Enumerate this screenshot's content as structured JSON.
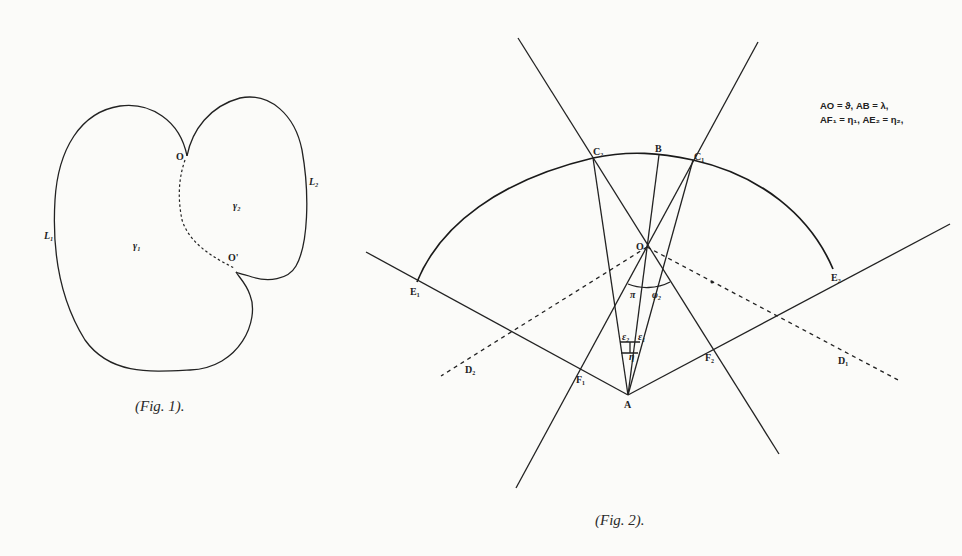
{
  "figure1": {
    "caption": "(Fig. 1).",
    "labels": {
      "O": "O",
      "O_prime": "O'",
      "L1": "L₁",
      "L2": "L₂",
      "gamma1": "γ₁",
      "gamma2": "γ₂"
    }
  },
  "figure2": {
    "caption": "(Fig. 2).",
    "legend": {
      "line1": "AO = ϑ,   AB = λ,",
      "line2": "AF₁ = η₁,   AE₂ = η₂,"
    },
    "labels": {
      "A": "A",
      "B": "B",
      "O": "O",
      "C1": "C₁",
      "C2": "C₂",
      "E1": "E₁",
      "E2": "E₂",
      "F1": "F₁",
      "F2": "F₂",
      "D1": "D₁",
      "D2": "D₂",
      "angle_pi": "π",
      "angle_phi2": "φ₂",
      "angle_epsilon2": "ε₂",
      "angle_epsilon1": "ε₁",
      "angle_eta": "η"
    }
  }
}
